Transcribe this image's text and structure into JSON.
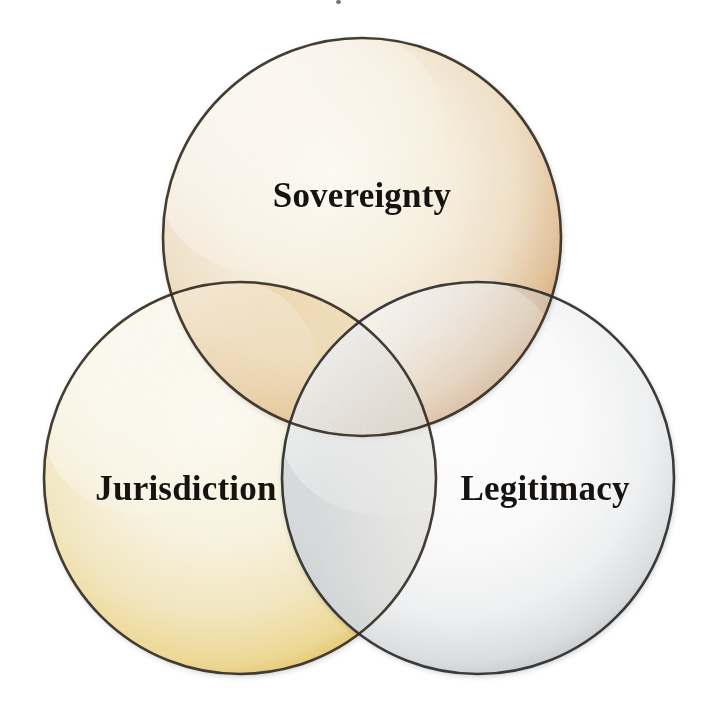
{
  "diagram": {
    "type": "venn",
    "set_count": 3,
    "background_color": "#ffffff",
    "title": "",
    "circles": [
      {
        "id": "sovereignty",
        "label": "Sovereignty",
        "position": "top",
        "cx": 362,
        "cy": 237,
        "r": 199,
        "rim_color": "#c98a55",
        "fill_center_color": "#f6f0e2",
        "outline_color": "#3a2f25",
        "label_x": 362,
        "label_y": 196
      },
      {
        "id": "jurisdiction",
        "label": "Jurisdiction",
        "position": "bottom-left",
        "cx": 240,
        "cy": 478,
        "r": 196,
        "rim_color": "#e3b749",
        "fill_center_color": "#f8f3e3",
        "outline_color": "#3a2f25",
        "label_x": 186,
        "label_y": 489
      },
      {
        "id": "legitimacy",
        "label": "Legitimacy",
        "position": "bottom-right",
        "cx": 478,
        "cy": 478,
        "r": 196,
        "rim_color": "#9ba0a4",
        "fill_center_color": "#fbfbfb",
        "outline_color": "#2e2e2e",
        "label_x": 545,
        "label_y": 489
      }
    ],
    "label_text_color": "#161310",
    "label_font_size_px": 35,
    "label_font_weight": "bold",
    "label_font_style": "serif"
  },
  "labels": {
    "sovereignty": "Sovereignty",
    "jurisdiction": "Jurisdiction",
    "legitimacy": "Legitimacy"
  }
}
